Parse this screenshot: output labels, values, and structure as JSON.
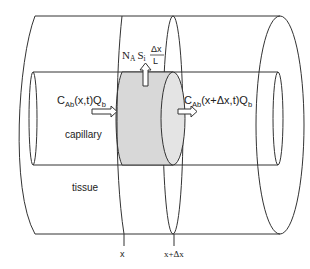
{
  "diagram": {
    "labels": {
      "inflow": {
        "base": "C",
        "sub": "Ab",
        "rest": "(x,t)Q",
        "sub2": "b"
      },
      "outflow": {
        "base": "C",
        "sub": "Ab",
        "rest": "(x+Δx,t)Q",
        "sub2": "b"
      },
      "transfer": {
        "n": "N",
        "n_sub": "A",
        "s": "S",
        "s_sub": "i",
        "num": "Δx",
        "den": "L"
      },
      "capillary": "capillary",
      "tissue": "tissue",
      "x_mark": "x",
      "x_dx_mark": "x+Δx"
    },
    "colors": {
      "line": "#333333",
      "slab_fill": "#d8d8d8",
      "slab_end_fill": "#e4e4e4",
      "background": "#ffffff"
    }
  }
}
